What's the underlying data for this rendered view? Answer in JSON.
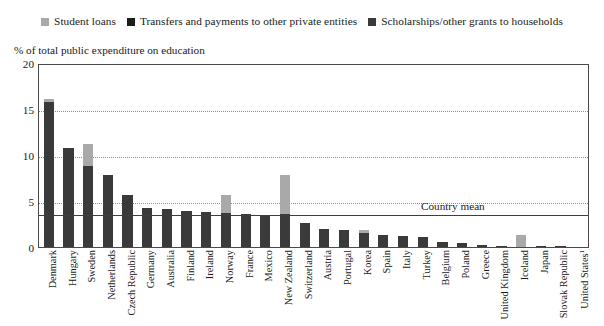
{
  "legend": {
    "items": [
      {
        "label": "Student loans",
        "color": "#a9a9a9",
        "name": "student-loans"
      },
      {
        "label": "Transfers and payments to other private entities",
        "color": "#1c1c1c",
        "name": "transfers-payments"
      },
      {
        "label": "Scholarships/other grants to households",
        "color": "#3a3a3a",
        "name": "scholarships-grants"
      }
    ]
  },
  "chart_data": {
    "type": "bar",
    "subtype": "stacked-vertical",
    "title": "",
    "axis_title": "% of total public expenditure on education",
    "xlabel": "",
    "ylabel": "% of total public expenditure on education",
    "ylim": [
      0,
      20
    ],
    "yticks": [
      0,
      5,
      10,
      15,
      20
    ],
    "grid": true,
    "grid_axis": "y",
    "legend_position": "top-center",
    "annotation": {
      "label": "Country mean",
      "value": 3.7,
      "line": "solid"
    },
    "categories": [
      "Denmark",
      "Hungary",
      "Sweden",
      "Netherlands",
      "Czech Republic",
      "Germany",
      "Australia",
      "Finland",
      "Ireland",
      "Norway",
      "France",
      "Mexico",
      "New Zealand",
      "Switzerland",
      "Austria",
      "Portugal",
      "Korea",
      "Spain",
      "Italy",
      "Turkey",
      "Belgium",
      "Poland",
      "Greece",
      "United Kingdom",
      "Iceland",
      "Japan",
      "Slovak Republic",
      "United States¹"
    ],
    "series": [
      {
        "name": "Scholarships/other grants to households",
        "color": "#3a3a3a",
        "values": [
          15.8,
          10.8,
          8.8,
          7.8,
          5.6,
          4.2,
          4.1,
          3.9,
          3.8,
          3.7,
          3.6,
          3.5,
          3.6,
          2.6,
          2.0,
          1.8,
          1.5,
          1.3,
          1.2,
          1.1,
          0.5,
          0.4,
          0.2,
          0.15,
          0.0,
          0.1,
          0.05,
          0.0
        ]
      },
      {
        "name": "Transfers and payments to other private entities",
        "color": "#1c1c1c",
        "values": [
          0,
          0,
          0,
          0,
          0,
          0,
          0,
          0,
          0,
          0,
          0,
          0,
          0,
          0,
          0,
          0,
          0,
          0,
          0,
          0,
          0,
          0,
          0,
          0,
          0,
          0,
          0,
          0
        ]
      },
      {
        "name": "Student loans",
        "color": "#a9a9a9",
        "values": [
          0.3,
          0.0,
          2.4,
          0.0,
          0.0,
          0.0,
          0.0,
          0.0,
          0.0,
          2.0,
          0.0,
          0.0,
          4.2,
          0.0,
          0.0,
          0.0,
          0.4,
          0.0,
          0.0,
          0.0,
          0.0,
          0.0,
          0.0,
          0.0,
          1.3,
          0.0,
          0.0,
          0.0
        ]
      }
    ],
    "totals": [
      16.1,
      10.8,
      11.2,
      7.8,
      5.6,
      4.2,
      4.1,
      3.9,
      3.8,
      5.7,
      3.6,
      3.5,
      7.8,
      2.6,
      2.0,
      1.8,
      1.9,
      1.3,
      1.2,
      1.1,
      0.5,
      0.4,
      0.2,
      0.15,
      1.3,
      0.1,
      0.05,
      0.0
    ]
  }
}
